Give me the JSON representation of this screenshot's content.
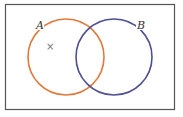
{
  "diagram": {
    "type": "venn",
    "sets": [
      {
        "name": "A",
        "label": "A",
        "color": "#e07a3c"
      },
      {
        "name": "B",
        "label": "B",
        "color": "#4d4f8f"
      }
    ],
    "marker": {
      "symbol": "×",
      "region": "A only"
    },
    "frame_color": "#555555"
  }
}
